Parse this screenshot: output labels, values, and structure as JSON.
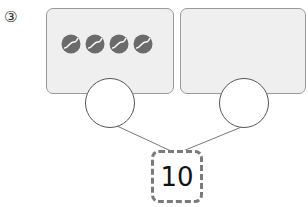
{
  "problem": {
    "number_label": "③",
    "left_part": {
      "ball_count": 4,
      "icon": "tennis-ball-icon",
      "answer": ""
    },
    "right_part": {
      "ball_count": 0,
      "answer": ""
    },
    "total": "10"
  },
  "colors": {
    "box_fill": "#efefef",
    "box_border": "#9a9a9a",
    "ball": "#6b6b6b",
    "dash": "#7a7a7a"
  }
}
